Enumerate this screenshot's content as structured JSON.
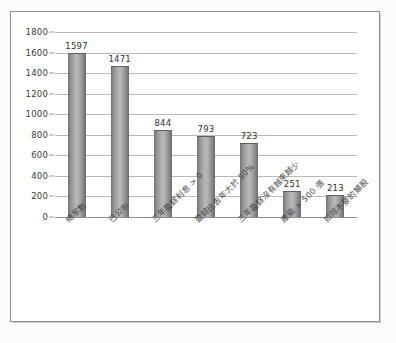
{
  "chart_data": {
    "type": "bar",
    "title": "",
    "xlabel": "",
    "ylabel": "",
    "ylim": [
      0,
      1800
    ],
    "ytick_step": 200,
    "yticks": [
      "1800",
      "1600",
      "1400",
      "1200",
      "1000",
      "800",
      "600",
      "400",
      "200",
      "0"
    ],
    "grid": true,
    "legend": "none",
    "categories": [
      "總家數",
      "已公布",
      "三年盈餘利息 > 0",
      "盈餘比去年大於 50%",
      "三年盈餘沒有越來越少",
      "產能 > 500 張",
      "扣除不要的類股"
    ],
    "values": [
      1597,
      1471,
      844,
      793,
      723,
      251,
      213
    ],
    "value_labels": [
      "1597",
      "1471",
      "844",
      "793",
      "723",
      "251",
      "213"
    ],
    "bar_color": "#a8a8a8",
    "gridline_color": "#b9b9b9",
    "axis_color": "#8f8f8f",
    "frame_color": "#8c8c8c",
    "background": "#ffffff"
  }
}
